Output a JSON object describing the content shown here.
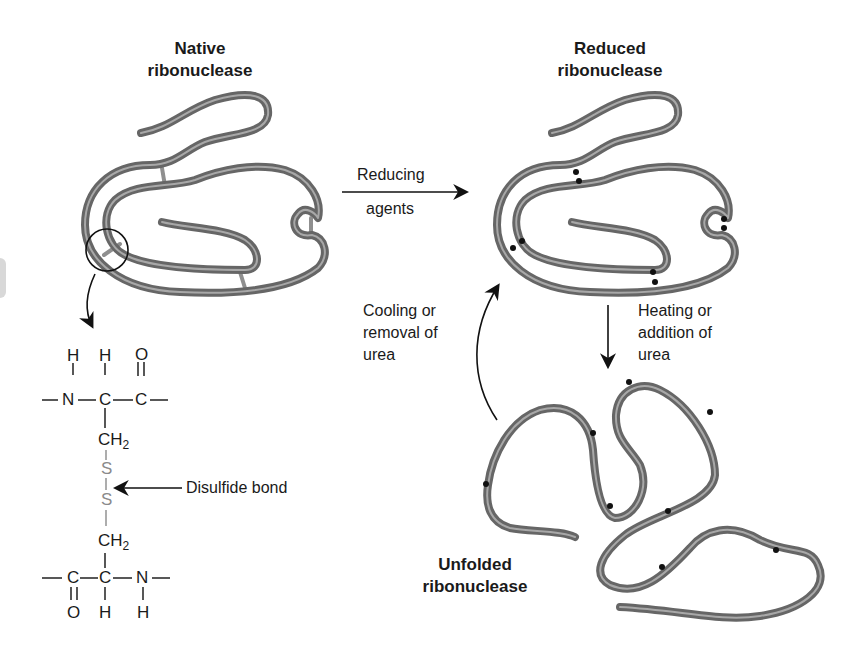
{
  "colors": {
    "chain": "#6b6b6b",
    "chain_highlight": "#a8a8a8",
    "disulfide_bridge": "#8f8f8f",
    "chem_box": "#d9d9d9",
    "sulfur": "#8a8a8a",
    "text": "#1a1a1a"
  },
  "states": {
    "native": {
      "title_line1": "Native",
      "title_line2": "ribonuclease"
    },
    "reduced": {
      "title_line1": "Reduced",
      "title_line2": "ribonuclease"
    },
    "unfolded": {
      "title_line1": "Unfolded",
      "title_line2": "ribonuclease"
    }
  },
  "transitions": {
    "reducing": {
      "line1": "Reducing",
      "line2": "agents"
    },
    "denature": {
      "line1": "Heating or",
      "line2": "addition of",
      "line3": "urea"
    },
    "renature": {
      "line1": "Cooling or",
      "line2": "removal of",
      "line3": "urea"
    }
  },
  "chemistry": {
    "top_residue": {
      "top_row": [
        "H",
        "H",
        "O"
      ],
      "backbone": [
        "N",
        "C",
        "C"
      ],
      "side_chain": "CH",
      "subscript": "2"
    },
    "bridge": {
      "sulfur1": "S",
      "sulfur2": "S",
      "callout": "Disulfide bond"
    },
    "bottom_residue": {
      "side_chain": "CH",
      "subscript": "2",
      "backbone": [
        "C",
        "C",
        "N"
      ],
      "bottom_row": [
        "O",
        "H",
        "H"
      ]
    }
  }
}
